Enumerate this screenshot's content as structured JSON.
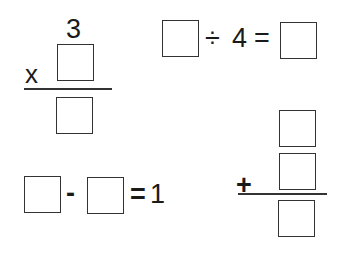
{
  "problems": {
    "multiplication": {
      "top_number": "3",
      "operator": "x",
      "boxes": [
        "",
        ""
      ]
    },
    "division": {
      "operator": "÷",
      "divisor": "4",
      "equals": "=",
      "boxes": [
        "",
        ""
      ]
    },
    "subtraction": {
      "operator": "-",
      "equals": "=",
      "result": "1",
      "boxes": [
        "",
        ""
      ]
    },
    "addition": {
      "operator": "+",
      "boxes": [
        "",
        "",
        ""
      ]
    }
  }
}
